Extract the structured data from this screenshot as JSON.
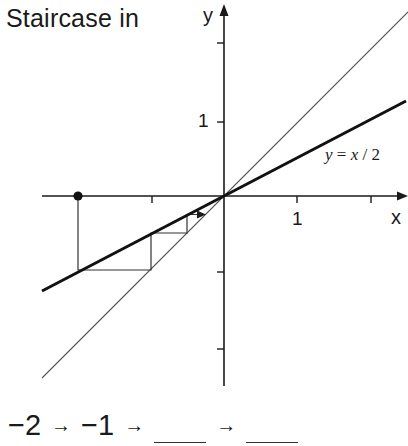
{
  "title": "Staircase in",
  "axes": {
    "x_label": "x",
    "y_label": "y",
    "x_tick_labels": [
      {
        "value": 1,
        "label": "1"
      }
    ],
    "y_tick_labels": [
      {
        "value": 1,
        "label": "1"
      }
    ],
    "x_ticks": [
      -1,
      1,
      2
    ],
    "y_ticks": [
      -2,
      -1,
      1,
      2
    ]
  },
  "curves": {
    "main_label": "y = x / 2",
    "main_label_parts": [
      "y",
      " = ",
      "x",
      " / 2"
    ],
    "diagonal": "y = x"
  },
  "staircase": {
    "start_point": [
      -2,
      0
    ],
    "points": [
      [
        -2,
        0
      ],
      [
        -2,
        -1
      ],
      [
        -1,
        -1
      ],
      [
        -1,
        -0.5
      ],
      [
        -0.5,
        -0.5
      ],
      [
        -0.5,
        -0.25
      ],
      [
        -0.25,
        -0.25
      ]
    ]
  },
  "sequence": {
    "items": [
      "−2",
      "−1"
    ],
    "arrow": "→",
    "blanks": 2
  },
  "colors": {
    "ink": "#1a1a1a",
    "thin_line": "#444444",
    "background": "#ffffff"
  }
}
